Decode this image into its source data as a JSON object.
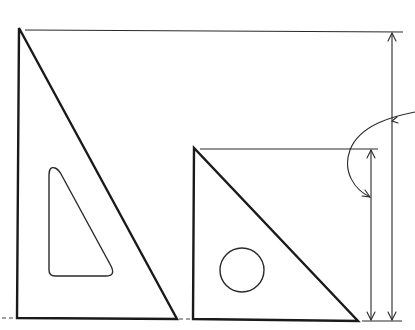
{
  "diagram": {
    "title": "",
    "colors": {
      "ink": "#1a1a1a",
      "background": "#ffffff"
    },
    "shapes": [
      {
        "id": "large-set-square",
        "kind": "right-triangle",
        "points": [
          [
            19,
            28
          ],
          [
            17,
            318
          ],
          [
            177,
            319
          ]
        ],
        "cutout": {
          "kind": "rounded-triangle",
          "points": [
            [
              52,
              168
            ],
            [
              49,
              275
            ],
            [
              113,
              275
            ]
          ]
        }
      },
      {
        "id": "small-set-square",
        "kind": "right-triangle",
        "points": [
          [
            194,
            148
          ],
          [
            193,
            319
          ],
          [
            358,
            321
          ]
        ],
        "cutout": {
          "kind": "circle",
          "center": [
            242,
            270
          ],
          "radius": 22
        }
      }
    ],
    "dimensions": [
      {
        "id": "large-height-dimension",
        "extension_line": {
          "from": [
            25,
            30
          ],
          "to": [
            403,
            32
          ]
        },
        "dimension_line": {
          "x": 392,
          "from_y": 33,
          "to_y": 320
        }
      },
      {
        "id": "small-height-dimension",
        "extension_line": {
          "from": [
            200,
            149
          ],
          "to": [
            378,
            149
          ]
        },
        "dimension_line": {
          "x": 371,
          "from_y": 150,
          "to_y": 320
        }
      }
    ],
    "baseline": {
      "from": [
        362,
        321
      ],
      "to": [
        402,
        321
      ]
    },
    "leader": {
      "id": "curved-leader-arrow",
      "path": "M415,112 C395,116 360,124 350,150 C342,172 355,190 370,197"
    },
    "labels": []
  }
}
